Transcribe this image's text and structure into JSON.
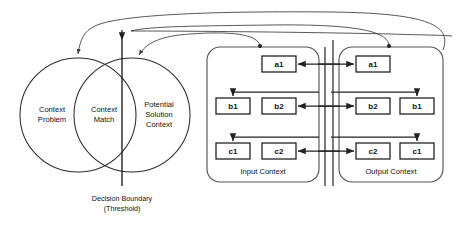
{
  "figure": {
    "background": "#ffffff",
    "line_color": "#222222",
    "text_color": "#111111"
  },
  "venn": {
    "left_circle": {
      "label_line1": "Context",
      "label_line2": "Problem"
    },
    "overlap": {
      "label_line1": "Context",
      "label_line2": "Match"
    },
    "right_circle": {
      "label_line1": "Potential",
      "label_line2": "Solution",
      "label_line3": "Context"
    }
  },
  "boundary": {
    "label_line1": "Decision Boundary",
    "label_line2": "(Threshold)"
  },
  "panels": [
    {
      "name": "input-context",
      "label": "Input Context",
      "rows": [
        {
          "left": null,
          "right": "a1"
        },
        {
          "left": "b1",
          "right": "b2"
        },
        {
          "left": "c1",
          "right": "c2"
        }
      ]
    },
    {
      "name": "output-context",
      "label": "Output Context",
      "rows": [
        {
          "left": "a1",
          "right": null
        },
        {
          "left": "b2",
          "right": "b1"
        },
        {
          "left": "c2",
          "right": "c1"
        }
      ]
    }
  ],
  "boxes": {
    "input_a1": "a1",
    "input_b1": "b1",
    "input_b2": "b2",
    "input_c1": "c1",
    "input_c2": "c2",
    "output_a1": "a1",
    "output_b2": "b2",
    "output_b1": "b1",
    "output_c2": "c2",
    "output_c1": "c1"
  }
}
